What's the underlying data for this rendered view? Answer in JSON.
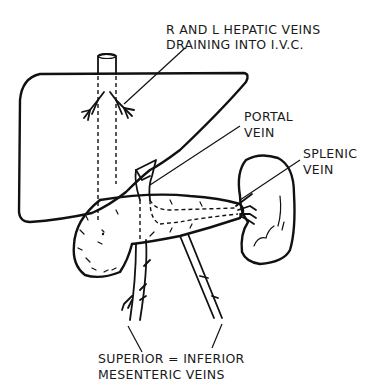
{
  "diagram": {
    "labels": {
      "hepatic_veins": {
        "line1": "R AND L HEPATIC VEINS",
        "line2": "DRAINING INTO I.V.C."
      },
      "portal_vein": {
        "line1": "PORTAL",
        "line2": "VEIN"
      },
      "splenic_vein": {
        "line1": "SPLENIC",
        "line2": "VEIN"
      },
      "mesenteric_veins": {
        "line1": "SUPERIOR = INFERIOR",
        "line2": "MESENTERIC VEINS"
      }
    },
    "structures": [
      "liver",
      "inferior vena cava",
      "hepatic veins",
      "portal vein",
      "pancreas",
      "spleen",
      "splenic vein",
      "superior mesenteric vein",
      "inferior mesenteric vein"
    ],
    "colors": {
      "ink": "#111111",
      "background": "#ffffff"
    }
  }
}
